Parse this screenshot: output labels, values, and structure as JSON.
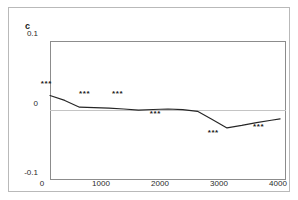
{
  "figure": {
    "panel_label": "c",
    "background_color": "#ffffff",
    "frame_color": "#b9b9b9",
    "axis_color": "#8c8c8c",
    "line_color": "#262626",
    "zero_line_color": "#c4c4c4"
  },
  "chart_data": {
    "type": "line",
    "title": "c",
    "xlabel": "",
    "ylabel": "",
    "xlim": [
      0,
      4000
    ],
    "ylim": [
      -0.1,
      0.1
    ],
    "xticks": [
      0,
      1000,
      2000,
      3000,
      4000
    ],
    "xtick_labels": [
      "0",
      "1000",
      "2000",
      "3000",
      "4000"
    ],
    "yticks": [
      0.1,
      0,
      -0.1
    ],
    "ytick_labels": [
      "0.1",
      "0",
      "-0.1"
    ],
    "grid": false,
    "legend": null,
    "zero_reference_line": 0,
    "series": [
      {
        "name": "effect",
        "x": [
          0,
          250,
          500,
          750,
          1000,
          1250,
          1500,
          1750,
          2000,
          2250,
          2500,
          2750,
          3000,
          3250,
          3500,
          3750,
          3900
        ],
        "values": [
          0.0215,
          0.0145,
          0.0048,
          0.0042,
          0.0035,
          0.0022,
          0.0005,
          0.0015,
          0.0022,
          0.0012,
          -0.0012,
          -0.013,
          -0.025,
          -0.0215,
          -0.0175,
          -0.014,
          -0.012
        ]
      }
    ],
    "annotations": [
      {
        "label": "***",
        "x": 80,
        "y": 0.0275,
        "significance": "p<0.001"
      },
      {
        "label": "***",
        "x": 730,
        "y": 0.0135,
        "significance": "p<0.001"
      },
      {
        "label": "***",
        "x": 1290,
        "y": 0.0135,
        "significance": "p<0.001"
      },
      {
        "label": "***",
        "x": 1930,
        "y": -0.015,
        "significance": "p<0.001"
      },
      {
        "label": "***",
        "x": 2910,
        "y": -0.042,
        "significance": "p<0.001"
      },
      {
        "label": "***",
        "x": 3680,
        "y": -0.034,
        "significance": "p<0.001"
      }
    ]
  }
}
